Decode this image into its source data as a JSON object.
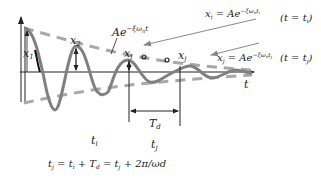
{
  "diagram": {
    "colors": {
      "curve": "#808080",
      "envelope": "#a0a0a0",
      "axis": "#222222",
      "arrow": "#888888",
      "text": "#222222"
    },
    "labels": {
      "x1": "x",
      "x1_sub": "1",
      "x2": "x",
      "x2_sub": "2",
      "xi": "x",
      "xi_sub": "i",
      "xj": "x",
      "xj_sub": "j",
      "envelope": "Ae",
      "envelope_exp": "−ξω",
      "envelope_exp_sub": "n",
      "envelope_exp_t": "t",
      "t_axis": "t",
      "Td": "T",
      "Td_sub": "d",
      "ti": "t",
      "ti_sub": "i",
      "tj": "t",
      "tj_sub": "j"
    },
    "equations": {
      "eq_i": "x",
      "eq_i_sub": "i",
      "eq_i_rhs": " = Ae",
      "eq_i_exp": "−ξω",
      "eq_i_exp_n": "n",
      "eq_i_exp_t": "t",
      "eq_i_exp_ti": "i",
      "eq_i_cond": "(t = t",
      "eq_i_cond_sub": "i",
      "eq_i_cond_end": ")",
      "eq_j": "x",
      "eq_j_sub": "j",
      "eq_j_rhs": " = Ae",
      "eq_j_exp": "−ξω",
      "eq_j_exp_n": "n",
      "eq_j_exp_t": "t",
      "eq_j_exp_tj": "j",
      "eq_j_cond": "(t = t",
      "eq_j_cond_sub": "j",
      "eq_j_cond_end": ")",
      "bottom": "t",
      "bottom_full": "t_j = t_i + T_d = t_j + 2π/ωd",
      "b_tj_sub": "j",
      "b_eq1": " = t",
      "b_ti_sub": "i",
      "b_plus": " + T",
      "b_Td_sub": "d",
      "b_eq2": " = t",
      "b_tj2_sub": "j",
      "b_tail": " + 2π/ωd"
    }
  }
}
